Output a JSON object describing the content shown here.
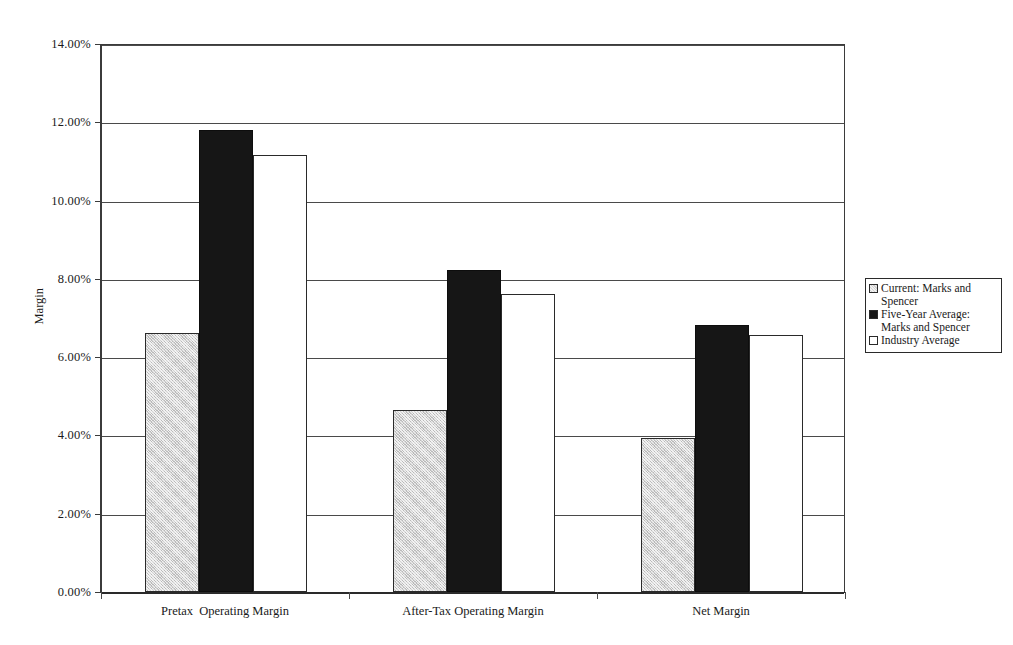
{
  "chart_data": {
    "type": "bar",
    "title": "",
    "xlabel": "",
    "ylabel": "Margin",
    "ylim": [
      0,
      14
    ],
    "ytick_labels": [
      "0.00%",
      "2.00%",
      "4.00%",
      "6.00%",
      "8.00%",
      "10.00%",
      "12.00%",
      "14.00%"
    ],
    "ytick_values": [
      0,
      2,
      4,
      6,
      8,
      10,
      12,
      14
    ],
    "grid": true,
    "legend_position": "right",
    "value_suffix": "%",
    "categories": [
      "Pretax  Operating Margin",
      "After-Tax Operating Margin",
      "Net Margin"
    ],
    "series": [
      {
        "name": "Current: Marks and Spencer",
        "key": "current",
        "color": "#d2d2d2",
        "values": [
          6.62,
          4.65,
          3.93
        ]
      },
      {
        "name": "Five-Year Average: Marks and Spencer",
        "key": "fiveyear",
        "color": "#161616",
        "values": [
          11.8,
          8.22,
          6.82
        ]
      },
      {
        "name": "Industry Average",
        "key": "industry",
        "color": "#ffffff",
        "values": [
          11.17,
          7.61,
          6.57
        ]
      }
    ]
  },
  "legend": {
    "entries": [
      {
        "label": "Current: Marks and Spencer",
        "series_key": "current"
      },
      {
        "label": "Five-Year Average: Marks and Spencer",
        "series_key": "fiveyear"
      },
      {
        "label": "Industry Average",
        "series_key": "industry"
      }
    ]
  },
  "axes": {
    "y_title": "Margin",
    "y_labels": [
      "14.00%",
      "12.00%",
      "10.00%",
      "8.00%",
      "6.00%",
      "4.00%",
      "2.00%",
      "0.00%"
    ],
    "x_labels": [
      "Pretax  Operating Margin",
      "After-Tax Operating Margin",
      "Net Margin"
    ]
  }
}
